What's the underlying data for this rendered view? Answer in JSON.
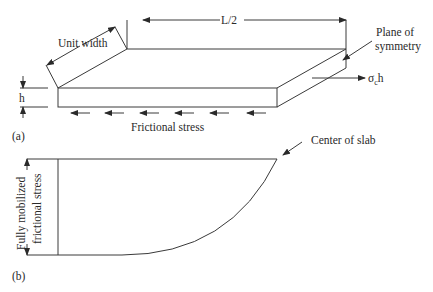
{
  "figure": {
    "part_a": {
      "tag": "(a)",
      "labels": {
        "unit_width": "Unit width",
        "half_length": "L/2",
        "plane_of_symmetry_line1": "Plane of",
        "plane_of_symmetry_line2": "symmetry",
        "thickness": "h",
        "force_sigma": "σ",
        "force_sub": "c",
        "force_h": "h",
        "frictional_stress": "Frictional stress"
      }
    },
    "part_b": {
      "tag": "(b)",
      "labels": {
        "center_of_slab": "Center of slab",
        "yaxis_line1": "Fully mobilized",
        "yaxis_line2": "frictional stress"
      }
    }
  }
}
